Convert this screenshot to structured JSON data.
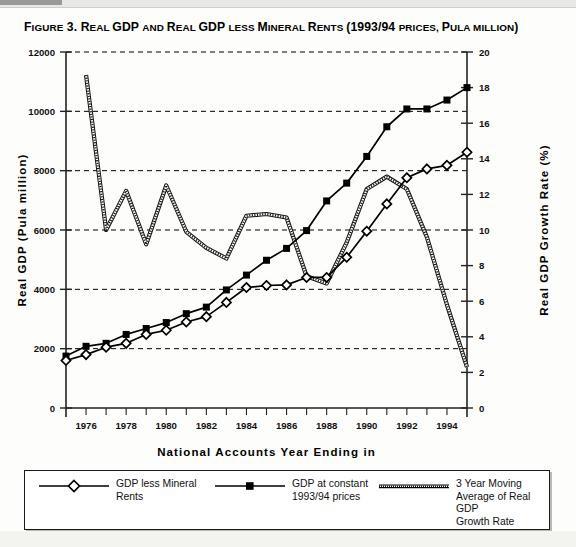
{
  "figure": {
    "label": "FIGURE 3.",
    "title_full": "FIGURE 3. REAL GDP AND REAL GDP LESS MINERAL RENTS (1993/94 PRICES, PULA MILLION)",
    "title_parts": [
      {
        "text": "F",
        "small": false
      },
      {
        "text": "IGURE",
        "small": true
      },
      {
        "text": " 3. R",
        "small": false
      },
      {
        "text": "EAL ",
        "small": true
      },
      {
        "text": "GDP ",
        "small": false
      },
      {
        "text": "AND ",
        "small": true
      },
      {
        "text": "R",
        "small": false
      },
      {
        "text": "EAL ",
        "small": true
      },
      {
        "text": "GDP ",
        "small": false
      },
      {
        "text": "LESS ",
        "small": true
      },
      {
        "text": "M",
        "small": false
      },
      {
        "text": "INERAL ",
        "small": true
      },
      {
        "text": "R",
        "small": false
      },
      {
        "text": "ENTS ",
        "small": true
      },
      {
        "text": "(1993/94 ",
        "small": false
      },
      {
        "text": "PRICES, ",
        "small": true
      },
      {
        "text": "P",
        "small": false
      },
      {
        "text": "ULA MILLION",
        "small": true
      },
      {
        "text": ")",
        "small": false
      }
    ]
  },
  "chart_data": {
    "type": "line",
    "title": "Real GDP and Real GDP less Mineral Rents (1993/94 prices, Pula million)",
    "xlabel": "National Accounts Year Ending in",
    "ylabel": "Real GDP (Pula million)",
    "y2label": "Real GDP Growth Rate (%)",
    "grid": true,
    "legend_position": "below",
    "xlim": [
      1975,
      1995
    ],
    "ylim": [
      0,
      12000
    ],
    "y2lim": [
      0,
      20
    ],
    "x": [
      1975,
      1976,
      1977,
      1978,
      1979,
      1980,
      1981,
      1982,
      1983,
      1984,
      1985,
      1986,
      1987,
      1988,
      1989,
      1990,
      1991,
      1992,
      1993,
      1994,
      1995
    ],
    "xticks": [
      1975,
      1976,
      1977,
      1978,
      1979,
      1980,
      1981,
      1982,
      1983,
      1984,
      1985,
      1986,
      1987,
      1988,
      1989,
      1990,
      1991,
      1992,
      1993,
      1994,
      1995
    ],
    "xtick_labels": [
      "",
      "1976",
      "",
      "1978",
      "",
      "1980",
      "",
      "1982",
      "",
      "1984",
      "",
      "1986",
      "",
      "1988",
      "",
      "1990",
      "",
      "1992",
      "",
      "1994",
      ""
    ],
    "yticks": [
      0,
      2000,
      4000,
      6000,
      8000,
      10000,
      12000
    ],
    "ytick_labels": [
      "0",
      "2000",
      "4000",
      "6000",
      "8000",
      "10000",
      "12000"
    ],
    "y2ticks": [
      0,
      2,
      4,
      6,
      8,
      10,
      12,
      14,
      16,
      18,
      20
    ],
    "y2tick_labels": [
      "0",
      "2",
      "4",
      "6",
      "8",
      "10",
      "12",
      "14",
      "16",
      "18",
      "20"
    ],
    "series": [
      {
        "name": "GDP less Mineral Rents",
        "marker": "diamond-open",
        "axis": "left",
        "values": [
          1600,
          1800,
          2050,
          2180,
          2480,
          2620,
          2900,
          3080,
          3560,
          4060,
          4130,
          4150,
          4400,
          4400,
          5080,
          5960,
          6880,
          7760,
          8060,
          8180,
          8620
        ]
      },
      {
        "name": "GDP at constant 1993/94 prices",
        "marker": "square-filled",
        "axis": "left",
        "values": [
          1750,
          2080,
          2180,
          2480,
          2680,
          2880,
          3180,
          3400,
          3980,
          4480,
          4980,
          5380,
          5980,
          6980,
          7580,
          8480,
          9480,
          10080,
          10080,
          10380,
          10800
        ]
      },
      {
        "name": "3 Year Moving Average of Real GDP Growth Rate",
        "marker": "none",
        "style": "double-hatched",
        "axis": "right",
        "values": [
          null,
          18.7,
          10.0,
          12.2,
          9.2,
          12.5,
          9.9,
          9.0,
          8.4,
          10.8,
          10.9,
          10.7,
          7.4,
          7.0,
          9.3,
          12.3,
          13.0,
          12.3,
          9.6,
          5.8,
          2.3
        ]
      }
    ]
  },
  "legend": {
    "entries": [
      {
        "label": "GDP less Mineral\nRents",
        "marker": "diamond-open"
      },
      {
        "label": "GDP at constant\n1993/94 prices",
        "marker": "square-filled"
      },
      {
        "label": "3 Year Moving\nAverage of Real GDP\nGrowth Rate",
        "marker": "hatched-line"
      }
    ]
  }
}
